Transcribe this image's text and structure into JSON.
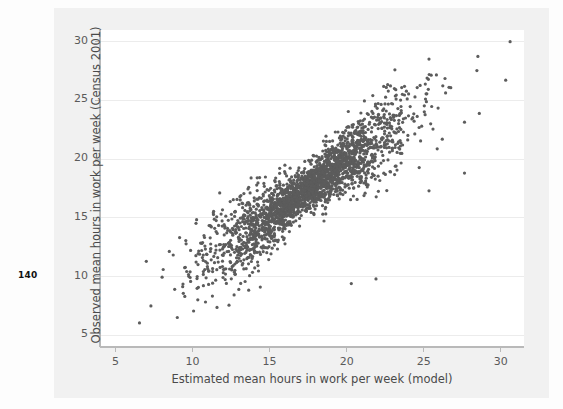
{
  "page": {
    "folio": "140"
  },
  "figure": {
    "x_axis": {
      "title": "Estimated mean hours in work per week (model)",
      "ticks": [
        5,
        10,
        15,
        20,
        25,
        30
      ],
      "min": 4.0,
      "max": 31.5
    },
    "y_axis": {
      "title": "Observed mean hours in work per week (Census 2001)",
      "ticks": [
        5,
        10,
        15,
        20,
        25,
        30
      ],
      "min": 4.0,
      "max": 31.0
    },
    "colors": {
      "point": "#5c5c5c",
      "grid": "#ececec",
      "axis": "#b9b9b9",
      "panel": "#ffffff",
      "page_tint": "#f1f1f1",
      "label": "#4a4a4a"
    }
  },
  "chart_data": {
    "type": "scatter",
    "title": "",
    "subtitle": "",
    "xlabel": "Estimated mean hours in work per week (model)",
    "ylabel": "Observed mean hours in work per week (Census 2001)",
    "xlim": [
      4.0,
      31.5
    ],
    "ylim": [
      4.0,
      31.0
    ],
    "xticks": [
      5,
      10,
      15,
      20,
      25,
      30
    ],
    "yticks": [
      5,
      10,
      15,
      20,
      25,
      30
    ],
    "grid": true,
    "grid_axis": "y",
    "legend": false,
    "marker": {
      "size": 1.6,
      "color": "#5c5c5c",
      "shape": "circle"
    },
    "n_points": 2500,
    "relationship": {
      "correlation": 0.86,
      "slope": 0.93,
      "intercept": 1.2,
      "residual_sd": 1.45,
      "x_mean": 17.4,
      "x_sd": 3.1,
      "heteroscedastic": true,
      "description": "Strong positive linear association; dense core near (17, 18.5) with fanning tails toward both extremes"
    },
    "outliers": [
      {
        "x": 30.6,
        "y": 30.0
      },
      {
        "x": 7.3,
        "y": 7.5
      },
      {
        "x": 7.0,
        "y": 11.3
      },
      {
        "x": 8.1,
        "y": 10.6
      },
      {
        "x": 10.3,
        "y": 9.0
      },
      {
        "x": 14.4,
        "y": 9.1
      },
      {
        "x": 20.3,
        "y": 9.4
      },
      {
        "x": 21.9,
        "y": 9.8
      },
      {
        "x": 26.2,
        "y": 21.7
      },
      {
        "x": 28.6,
        "y": 23.9
      },
      {
        "x": 22.4,
        "y": 26.2
      },
      {
        "x": 25.3,
        "y": 26.8
      }
    ]
  }
}
